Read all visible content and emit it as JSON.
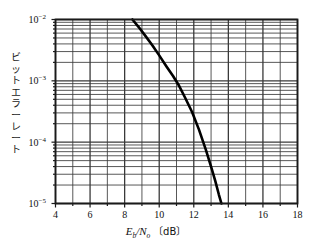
{
  "chart_data": {
    "type": "line",
    "title": "",
    "xlabel": "Eb/No [dB]",
    "ylabel": "ビットエラーレート",
    "xlabel_parts": {
      "e": "E",
      "e_sub": "b",
      "slash": "/",
      "n": "N",
      "n_sub": "o",
      "unit_open": "〔",
      "unit": "dB",
      "unit_close": "〕"
    },
    "xlim": [
      4,
      18
    ],
    "ylim": [
      1e-05,
      0.01
    ],
    "yscale": "log",
    "xscale": "linear",
    "grid": true,
    "legend": "none",
    "xticks": [
      4,
      6,
      8,
      10,
      12,
      14,
      16,
      18
    ],
    "xtick_labels": [
      "4",
      "6",
      "8",
      "10",
      "12",
      "14",
      "16",
      "18"
    ],
    "xminor_ticks": [
      5,
      7,
      9,
      11,
      13,
      15,
      17
    ],
    "yticks": [
      0.01,
      0.001,
      0.0001,
      1e-05
    ],
    "ytick_labels": [
      "10⁻²",
      "10⁻³",
      "10⁻⁴",
      "10⁻⁵"
    ],
    "ytick_mantissa": "10",
    "ytick_exponents": [
      "-2",
      "-3",
      "-4",
      "-5"
    ],
    "series": [
      {
        "name": "BER",
        "color": "#000000",
        "linewidth": 2.6,
        "x": [
          8.45,
          8.8,
          9.2,
          9.6,
          10.0,
          10.4,
          10.8,
          11.15,
          11.5,
          11.9,
          12.3,
          12.7,
          13.0,
          13.25,
          13.45,
          13.6
        ],
        "y": [
          0.01,
          0.0076,
          0.0054,
          0.0038,
          0.0026,
          0.00175,
          0.0012,
          0.00083,
          0.00053,
          0.00031,
          0.00016,
          7.5e-05,
          4e-05,
          2.3e-05,
          1.4e-05,
          1e-05
        ]
      }
    ],
    "annotations": []
  },
  "axis_style": {
    "frame_color": "#1a1a1a",
    "grid_color": "#3a3a3a",
    "background": "#ffffff"
  }
}
